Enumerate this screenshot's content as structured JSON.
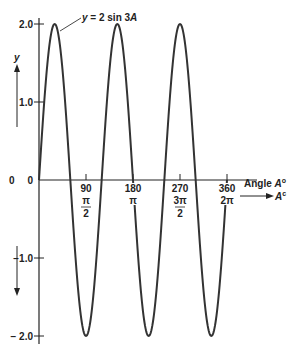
{
  "chart_data": {
    "type": "line",
    "title": "",
    "function_label": "y = 2 sin 3A",
    "xlabel": "Angle A°",
    "xlabel_secondary": "A^c",
    "ylabel": "y",
    "xlim": [
      0,
      360
    ],
    "ylim": [
      -2.0,
      2.0
    ],
    "x_ticks": [
      90,
      180,
      270,
      360
    ],
    "x_tick_labels": [
      "90",
      "180",
      "270",
      "360"
    ],
    "x_tick_radian_labels": [
      {
        "num": "π",
        "den": "2"
      },
      {
        "num": "π",
        "den": ""
      },
      {
        "num": "3π",
        "den": "2"
      },
      {
        "num": "2π",
        "den": ""
      }
    ],
    "y_ticks": [
      2.0,
      1.0,
      0,
      -1.0,
      -2.0
    ],
    "y_tick_labels": [
      "2.0",
      "1.0",
      "0",
      "−1.0",
      "− 2.0"
    ],
    "grid": false,
    "series": [
      {
        "name": "y = 2 sin 3A",
        "x": [
          0,
          30,
          60,
          90,
          120,
          150,
          180,
          210,
          240,
          270,
          300,
          330,
          360
        ],
        "values": [
          0,
          2.0,
          0,
          -2.0,
          0,
          2.0,
          0,
          -2.0,
          0,
          2.0,
          0,
          -2.0,
          0
        ]
      }
    ],
    "amplitude": 2,
    "period_degrees": 120
  },
  "labels": {
    "origin": "0",
    "y_axis": "y",
    "x_axis_deg": "Angle A",
    "x_axis_deg_sup": "o",
    "x_axis_rad": "A",
    "x_axis_rad_sup": "c",
    "curve_annotation": "y = 2 sin 3A"
  }
}
